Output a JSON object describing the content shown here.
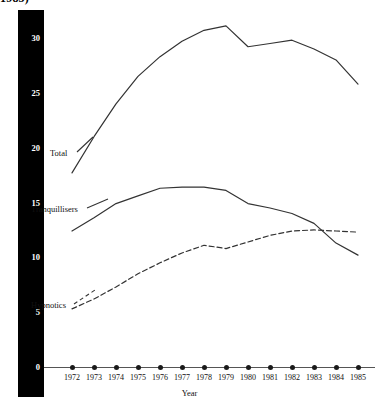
{
  "title": "1985)",
  "axis": {
    "ylabel": "Benzodiazepine prescription items dispensed (millions)",
    "xlabel": "Year",
    "yticks": [
      "0",
      "5",
      "10",
      "15",
      "20",
      "25",
      "30"
    ]
  },
  "series_labels": {
    "total": "Total",
    "tranquillisers": "Tranquillisers",
    "hypnotics": "Hypnotics"
  },
  "chart_data": {
    "type": "line",
    "title": "1985)",
    "xlabel": "Year",
    "ylabel": "Benzodiazepine prescription items dispensed (millions)",
    "x": [
      1972,
      1973,
      1974,
      1975,
      1976,
      1977,
      1978,
      1979,
      1980,
      1981,
      1982,
      1983,
      1984,
      1985
    ],
    "xlim": [
      1972,
      1985
    ],
    "ylim": [
      0,
      32.5
    ],
    "yticks": [
      0,
      5,
      10,
      15,
      20,
      25,
      30
    ],
    "grid": false,
    "legend": "inline-annotations",
    "series": [
      {
        "name": "Total",
        "style": "solid",
        "color": "#333333",
        "values": [
          17.7,
          21.0,
          24.0,
          26.5,
          28.3,
          29.7,
          30.7,
          31.1,
          29.2,
          29.5,
          29.8,
          29.0,
          28.0,
          25.8
        ]
      },
      {
        "name": "Tranquillisers",
        "style": "solid",
        "color": "#333333",
        "values": [
          12.4,
          13.6,
          14.9,
          15.6,
          16.3,
          16.4,
          16.4,
          16.1,
          14.9,
          14.5,
          14.0,
          13.1,
          11.3,
          10.2
        ]
      },
      {
        "name": "Hypnotics",
        "style": "dashed",
        "color": "#333333",
        "values": [
          5.3,
          6.2,
          7.3,
          8.5,
          9.5,
          10.4,
          11.1,
          10.8,
          11.4,
          12.0,
          12.4,
          12.5,
          12.4,
          12.3
        ]
      }
    ]
  }
}
